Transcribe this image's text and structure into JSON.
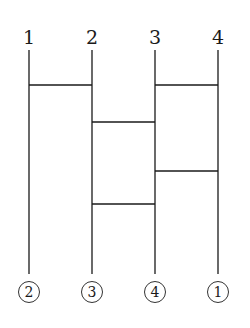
{
  "diagram": {
    "type": "ladder (amidakuji)",
    "top_labels": [
      "1",
      "2",
      "3",
      "4"
    ],
    "bottom_labels": [
      "2",
      "3",
      "4",
      "1"
    ],
    "columns_x": [
      29,
      92,
      155,
      218
    ],
    "line_top_y": 50,
    "line_bottom_y": 274,
    "rungs": [
      {
        "from_col": 0,
        "to_col": 1,
        "y": 85
      },
      {
        "from_col": 2,
        "to_col": 3,
        "y": 85
      },
      {
        "from_col": 1,
        "to_col": 2,
        "y": 122
      },
      {
        "from_col": 2,
        "to_col": 3,
        "y": 171
      },
      {
        "from_col": 1,
        "to_col": 2,
        "y": 204
      }
    ],
    "line_color": "#1a1a1a"
  }
}
